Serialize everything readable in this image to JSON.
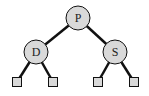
{
  "diagram": {
    "type": "binary-tree",
    "colors": {
      "node_fill": "#d9d9d9",
      "stroke": "#111111",
      "edge": "#111111",
      "leaf_fill": "#d9d9d9"
    },
    "nodes": [
      {
        "id": "P",
        "label": "P",
        "kind": "internal"
      },
      {
        "id": "D",
        "label": "D",
        "kind": "internal",
        "parent": "P"
      },
      {
        "id": "S",
        "label": "S",
        "kind": "internal",
        "parent": "P"
      },
      {
        "id": "L1",
        "label": "",
        "kind": "leaf",
        "parent": "D"
      },
      {
        "id": "L2",
        "label": "",
        "kind": "leaf",
        "parent": "D"
      },
      {
        "id": "L3",
        "label": "",
        "kind": "leaf",
        "parent": "S"
      },
      {
        "id": "L4",
        "label": "",
        "kind": "leaf",
        "parent": "S"
      }
    ]
  }
}
